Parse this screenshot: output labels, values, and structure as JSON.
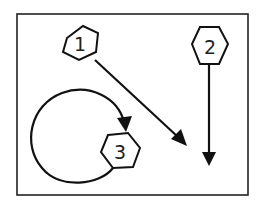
{
  "diagram": {
    "frame": {
      "x": 17,
      "y": 14,
      "w": 231,
      "h": 181
    },
    "stroke_color": "#111111",
    "nodes": [
      {
        "id": "1",
        "label": "1",
        "cx": 80,
        "cy": 45
      },
      {
        "id": "2",
        "label": "2",
        "cx": 209,
        "cy": 46
      },
      {
        "id": "3",
        "label": "3",
        "cx": 120,
        "cy": 152
      }
    ],
    "edges": [
      {
        "from": "1",
        "type": "straight-arrow",
        "direction": "down-right"
      },
      {
        "from": "2",
        "type": "straight-arrow",
        "direction": "down"
      },
      {
        "from": "3",
        "to": "3",
        "type": "loop-arrow"
      }
    ]
  }
}
